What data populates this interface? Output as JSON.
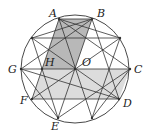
{
  "figure": {
    "circle": {
      "cx": 75,
      "cy": 69,
      "r": 54
    },
    "points": {
      "A": [
        59,
        19
      ],
      "B": [
        92,
        19
      ],
      "P1": [
        32,
        38
      ],
      "P2": [
        120,
        38
      ],
      "G": [
        21,
        69
      ],
      "H": [
        42,
        69
      ],
      "O": [
        75,
        69
      ],
      "C": [
        130,
        69
      ],
      "F": [
        32,
        99
      ],
      "D": [
        119,
        99
      ],
      "E": [
        58,
        118
      ],
      "P3": [
        92,
        118
      ]
    },
    "labels": {
      "A": "A",
      "B": "B",
      "C": "C",
      "D": "D",
      "E": "E",
      "F": "F",
      "G": "G",
      "H": "H",
      "O": "O"
    },
    "colors": {
      "dark_shade": "#b8b8b8",
      "light_shade": "#dcdcdc",
      "stroke": "#333333"
    }
  }
}
